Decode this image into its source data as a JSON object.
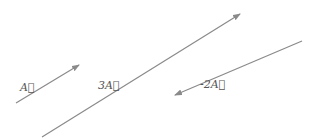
{
  "diagram": {
    "title": "",
    "line_color": "#8a8a8a",
    "label_color": "#555555",
    "vectors": [
      {
        "name": "A",
        "label": "A⃗",
        "x1": 16,
        "y1": 103,
        "x2": 79,
        "y2": 65,
        "lx": 20,
        "ly": 81
      },
      {
        "name": "3A",
        "label": "3A⃗",
        "x1": 42,
        "y1": 137,
        "x2": 240,
        "y2": 14,
        "lx": 98,
        "ly": 79
      },
      {
        "name": "-2A",
        "label": "-2A⃗",
        "x1": 302,
        "y1": 41,
        "x2": 175,
        "y2": 95,
        "lx": 200,
        "ly": 78
      }
    ]
  }
}
